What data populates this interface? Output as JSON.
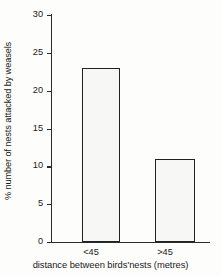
{
  "chart_data": {
    "type": "bar",
    "title": "",
    "subtitle": "",
    "categories": [
      "<45",
      ">45"
    ],
    "values": [
      23,
      11
    ],
    "series": [
      {
        "name": "% number of nests attacked by weasels",
        "values": [
          23,
          11
        ]
      }
    ],
    "xlabel": "distance between birds'nests (metres)",
    "ylabel": "% number of nests attacked by weasels",
    "ylim": [
      0,
      30
    ],
    "yticks": [
      0,
      5,
      10,
      15,
      20,
      25,
      30
    ],
    "ytick_labels": [
      "0",
      "5",
      "10",
      "15",
      "20",
      "25",
      "30"
    ],
    "grid": false,
    "legend": false,
    "legend_position": "none",
    "bar_fill": "stippled-dots",
    "bar_border_color": "#222222",
    "bar_fill_color": "#f7f7f5",
    "axis_color": "#2b2b2b",
    "background_color": "#fdfdfc"
  }
}
